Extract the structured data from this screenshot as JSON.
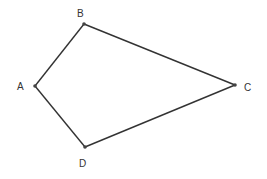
{
  "diagram": {
    "type": "quadrilateral",
    "stroke_color": "#333333",
    "vertices": [
      {
        "id": "A",
        "label": "A",
        "x": 35,
        "y": 86,
        "label_x": 17,
        "label_y": 90
      },
      {
        "id": "B",
        "label": "B",
        "x": 84,
        "y": 24,
        "label_x": 77,
        "label_y": 17
      },
      {
        "id": "C",
        "label": "C",
        "x": 235,
        "y": 85,
        "label_x": 244,
        "label_y": 91
      },
      {
        "id": "D",
        "label": "D",
        "x": 85,
        "y": 147,
        "label_x": 79,
        "label_y": 167
      }
    ],
    "edges": [
      [
        "A",
        "B"
      ],
      [
        "B",
        "C"
      ],
      [
        "C",
        "D"
      ],
      [
        "D",
        "A"
      ]
    ]
  }
}
